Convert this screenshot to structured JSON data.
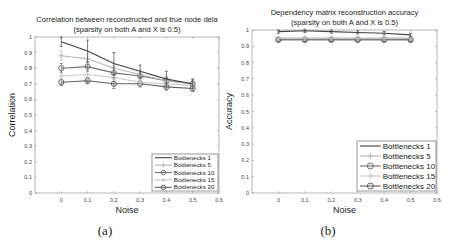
{
  "chart_data": [
    {
      "type": "line",
      "panel_label": "(a)",
      "title": "Correlation between reconstructed and true node dela",
      "subtitle": "(sparsity on both A and X is 0.5)",
      "xlabel": "Noise",
      "ylabel": "Correlation",
      "xlim": [
        -0.1,
        0.6
      ],
      "ylim": [
        0,
        1
      ],
      "xticks": [
        "0",
        "0.1",
        "0.2",
        "0.3",
        "0.4",
        "0.5",
        "0.6"
      ],
      "yticks": [
        "0",
        "0.1",
        "0.2",
        "0.3",
        "0.4",
        "0.5",
        "0.6",
        "0.7",
        "0.8",
        "0.9",
        "1"
      ],
      "grid": false,
      "legend_position": "lower right",
      "x": [
        0,
        0.1,
        0.2,
        0.3,
        0.4,
        0.5
      ],
      "series": [
        {
          "name": "Bottlenecks 1",
          "values": [
            0.97,
            0.91,
            0.83,
            0.78,
            0.73,
            0.7
          ],
          "err": [
            0.03,
            0.07,
            0.07,
            0.04,
            0.05,
            0.03
          ],
          "color": "#404040",
          "marker": "none"
        },
        {
          "name": "Bottlenecks 5",
          "values": [
            0.88,
            0.86,
            0.8,
            0.76,
            0.72,
            0.7
          ],
          "err": [
            0.03,
            0.03,
            0.03,
            0.03,
            0.03,
            0.03
          ],
          "color": "#b8b8b8",
          "marker": "plus"
        },
        {
          "name": "Bottlenecks 10",
          "values": [
            0.8,
            0.81,
            0.77,
            0.75,
            0.72,
            0.7
          ],
          "err": [
            0.03,
            0.03,
            0.03,
            0.02,
            0.02,
            0.02
          ],
          "color": "#707070",
          "marker": "circle"
        },
        {
          "name": "Bottlenecks 15",
          "values": [
            0.75,
            0.76,
            0.74,
            0.71,
            0.7,
            0.69
          ],
          "err": [
            0.03,
            0.03,
            0.02,
            0.02,
            0.02,
            0.02
          ],
          "color": "#c8c8c8",
          "marker": "plus"
        },
        {
          "name": "Bottlenecks 20",
          "values": [
            0.71,
            0.72,
            0.7,
            0.7,
            0.68,
            0.67
          ],
          "err": [
            0.02,
            0.02,
            0.03,
            0.02,
            0.02,
            0.02
          ],
          "color": "#606060",
          "marker": "circle"
        }
      ]
    },
    {
      "type": "line",
      "panel_label": "(b)",
      "title": "Dependency matrix reconstruction accuracy",
      "subtitle": "(sparsity on both A and X is 0.5)",
      "xlabel": "Noise",
      "ylabel": "Accuracy",
      "xlim": [
        -0.1,
        0.6
      ],
      "ylim": [
        0,
        1
      ],
      "xticks": [
        "0",
        "0.1",
        "0.2",
        "0.3",
        "0.4",
        "0.5",
        "0.6"
      ],
      "yticks": [
        "0",
        "0.1",
        "0.2",
        "0.3",
        "0.4",
        "0.5",
        "0.6",
        "0.7",
        "0.8",
        "0.9",
        "1"
      ],
      "grid": false,
      "legend_position": "lower right",
      "x": [
        0,
        0.1,
        0.2,
        0.3,
        0.4,
        0.5
      ],
      "series": [
        {
          "name": "Bottlenecks 1",
          "values": [
            0.99,
            0.995,
            0.99,
            0.985,
            0.98,
            0.97
          ],
          "err": [
            0.01,
            0.01,
            0.01,
            0.01,
            0.01,
            0.01
          ],
          "color": "#404040",
          "marker": "none"
        },
        {
          "name": "Bottlenecks 5",
          "values": [
            0.95,
            0.95,
            0.95,
            0.95,
            0.95,
            0.95
          ],
          "err": [
            0.01,
            0.01,
            0.01,
            0.01,
            0.01,
            0.01
          ],
          "color": "#b8b8b8",
          "marker": "plus"
        },
        {
          "name": "Bottlenecks 10",
          "values": [
            0.94,
            0.94,
            0.94,
            0.94,
            0.94,
            0.94
          ],
          "err": [
            0.01,
            0.01,
            0.01,
            0.01,
            0.01,
            0.01
          ],
          "color": "#707070",
          "marker": "circle"
        },
        {
          "name": "Bottlenecks 15",
          "values": [
            0.945,
            0.945,
            0.945,
            0.945,
            0.945,
            0.945
          ],
          "err": [
            0.01,
            0.01,
            0.01,
            0.01,
            0.01,
            0.01
          ],
          "color": "#c8c8c8",
          "marker": "plus"
        },
        {
          "name": "Bottlenecks 20",
          "values": [
            0.94,
            0.94,
            0.94,
            0.94,
            0.94,
            0.94
          ],
          "err": [
            0.01,
            0.01,
            0.01,
            0.01,
            0.01,
            0.01
          ],
          "color": "#606060",
          "marker": "circle"
        }
      ]
    }
  ],
  "layout": [
    {
      "left": 35,
      "right": 219,
      "top": 37,
      "bottom": 193,
      "title_y": 22,
      "subtitle_y": 32,
      "legend_x": 152,
      "legend_y": 154,
      "legend_w": 66,
      "legend_h": 37,
      "legend_font": 6.2,
      "caption_x": 105
    },
    {
      "left": 252,
      "right": 437,
      "top": 30,
      "bottom": 193,
      "title_y": 15,
      "subtitle_y": 25,
      "legend_x": 357,
      "legend_y": 141,
      "legend_w": 79,
      "legend_h": 50,
      "legend_font": 8,
      "caption_x": 328
    }
  ]
}
